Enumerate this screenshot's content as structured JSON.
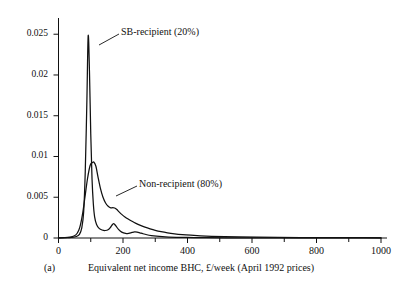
{
  "figure": {
    "panel_label": "(a)",
    "xlabel": "Equivalent net income BHC, £/week (April 1992 prices)",
    "ylabel": ""
  },
  "annotations": {
    "sb": "SB-recipient (20%)",
    "non": "Non-recipient (80%)"
  },
  "chart_data": {
    "type": "line",
    "title": "",
    "xlabel": "Equivalent net income BHC, £/week (April 1992 prices)",
    "ylabel": "",
    "xlim": [
      0,
      1000
    ],
    "ylim": [
      0,
      0.0265
    ],
    "xticks": [
      0,
      200,
      400,
      600,
      800,
      1000
    ],
    "xtick_labels": [
      "0",
      "200",
      "400",
      "600",
      "800",
      "1000"
    ],
    "xminor_ticks": [
      100,
      300,
      500,
      700,
      900
    ],
    "yticks": [
      0,
      0.005,
      0.01,
      0.015,
      0.02,
      0.025
    ],
    "ytick_labels": [
      "0",
      "0.005",
      "0.01",
      "0.015",
      "0.02",
      "0.025"
    ],
    "grid": false,
    "legend_position": "inline-annotations",
    "series": [
      {
        "name": "SB-recipient (20%)",
        "annotation": "SB-recipient (20%)",
        "color": "#111111",
        "x": [
          0,
          20,
          40,
          55,
          65,
          72,
          78,
          83,
          88,
          92,
          96,
          100,
          104,
          108,
          112,
          118,
          126,
          135,
          145,
          155,
          162,
          168,
          172,
          178,
          186,
          196,
          208,
          218,
          228,
          236,
          244,
          252,
          262,
          274,
          288,
          304,
          322,
          342,
          366,
          392,
          420,
          460,
          520,
          600,
          700,
          800,
          900,
          1000
        ],
        "y": [
          2e-05,
          4e-05,
          8e-05,
          0.00018,
          0.00045,
          0.0012,
          0.0032,
          0.0082,
          0.0168,
          0.0248,
          0.0205,
          0.0128,
          0.0072,
          0.0042,
          0.0026,
          0.00165,
          0.00118,
          0.00098,
          0.00092,
          0.00105,
          0.00135,
          0.00168,
          0.00175,
          0.00148,
          0.00105,
          0.00072,
          0.00056,
          0.00058,
          0.00068,
          0.00074,
          0.00072,
          0.00064,
          0.00052,
          0.0004,
          0.0003,
          0.00022,
          0.00016,
          0.00012,
          9e-05,
          7e-05,
          5e-05,
          4e-05,
          3e-05,
          2e-05,
          2e-05,
          1e-05,
          1e-05,
          1e-05
        ]
      },
      {
        "name": "Non-recipient (80%)",
        "annotation": "Non-recipient (80%)",
        "color": "#111111",
        "x": [
          0,
          20,
          35,
          48,
          58,
          66,
          74,
          82,
          90,
          98,
          105,
          110,
          116,
          122,
          130,
          138,
          146,
          154,
          162,
          168,
          174,
          180,
          188,
          196,
          206,
          216,
          228,
          240,
          254,
          268,
          284,
          300,
          318,
          338,
          360,
          384,
          410,
          440,
          475,
          515,
          560,
          615,
          680,
          750,
          830,
          910,
          1000
        ],
        "y": [
          2e-05,
          4e-05,
          0.0001,
          0.00024,
          0.00058,
          0.0013,
          0.0028,
          0.005,
          0.0073,
          0.0089,
          0.00925,
          0.0093,
          0.0088,
          0.0076,
          0.0061,
          0.005,
          0.0043,
          0.0039,
          0.0037,
          0.00372,
          0.00368,
          0.00352,
          0.0032,
          0.0029,
          0.00258,
          0.00232,
          0.00205,
          0.0018,
          0.00155,
          0.00133,
          0.00112,
          0.00094,
          0.00078,
          0.00064,
          0.00052,
          0.00042,
          0.00034,
          0.00027,
          0.00021,
          0.00016,
          0.00013,
          0.0001,
          8e-05,
          6e-05,
          5e-05,
          4e-05,
          3e-05
        ]
      }
    ]
  }
}
